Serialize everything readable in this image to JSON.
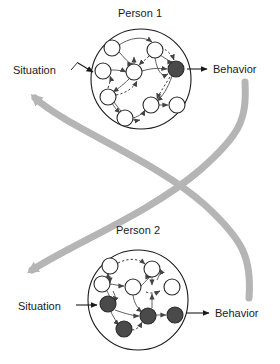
{
  "figure": {
    "type": "conceptual-diagram"
  },
  "panels": [
    {
      "id": "person1",
      "title": "Person 1",
      "input_label": "Situation",
      "output_label": "Behavior"
    },
    {
      "id": "person2",
      "title": "Person 2",
      "input_label": "Situation",
      "output_label": "Behavior"
    }
  ],
  "colors": {
    "node_fill_empty": "#ffffff",
    "node_fill_active": "#4a4a4a",
    "node_stroke": "#2b2b2b",
    "edge": "#555555",
    "boundary": "#1a1a1a",
    "feedback_arrow": "#b5b5b5",
    "text": "#1a1a1a",
    "background": "#ffffff"
  },
  "network_person1": {
    "boundary": {
      "cx": 141,
      "cy": 79,
      "r": 50
    },
    "nodes": [
      {
        "id": "p1n1",
        "cx": 112,
        "cy": 48,
        "r": 8,
        "state": "inactive"
      },
      {
        "id": "p1n2",
        "cx": 155,
        "cy": 50,
        "r": 8,
        "state": "inactive"
      },
      {
        "id": "p1n3",
        "cx": 103,
        "cy": 71,
        "r": 8,
        "state": "inactive"
      },
      {
        "id": "p1n4",
        "cx": 134,
        "cy": 72,
        "r": 8,
        "state": "inactive"
      },
      {
        "id": "p1n5",
        "cx": 176,
        "cy": 69,
        "r": 8,
        "state": "active"
      },
      {
        "id": "p1n6",
        "cx": 108,
        "cy": 97,
        "r": 8,
        "state": "inactive"
      },
      {
        "id": "p1n7",
        "cx": 151,
        "cy": 105,
        "r": 8,
        "state": "inactive"
      },
      {
        "id": "p1n8",
        "cx": 177,
        "cy": 105,
        "r": 8,
        "state": "inactive"
      },
      {
        "id": "p1n9",
        "cx": 125,
        "cy": 118,
        "r": 8,
        "state": "inactive"
      }
    ],
    "edge_count": 13,
    "dashed_edge_count": 5
  },
  "network_person2": {
    "boundary": {
      "cx": 138,
      "cy": 300,
      "r": 50
    },
    "nodes": [
      {
        "id": "p2n1",
        "cx": 110,
        "cy": 266,
        "r": 8,
        "state": "inactive"
      },
      {
        "id": "p2n2",
        "cx": 152,
        "cy": 269,
        "r": 8,
        "state": "inactive"
      },
      {
        "id": "p2n3",
        "cx": 102,
        "cy": 284,
        "r": 8,
        "state": "inactive"
      },
      {
        "id": "p2n4",
        "cx": 133,
        "cy": 287,
        "r": 8,
        "state": "inactive"
      },
      {
        "id": "p2n5",
        "cx": 172,
        "cy": 287,
        "r": 8,
        "state": "inactive"
      },
      {
        "id": "p2n6",
        "cx": 108,
        "cy": 304,
        "r": 8,
        "state": "active"
      },
      {
        "id": "p2n7",
        "cx": 148,
        "cy": 316,
        "r": 8,
        "state": "active"
      },
      {
        "id": "p2n8",
        "cx": 175,
        "cy": 315,
        "r": 8,
        "state": "active"
      },
      {
        "id": "p2n9",
        "cx": 124,
        "cy": 329,
        "r": 8,
        "state": "active"
      }
    ],
    "edge_count": 13,
    "dashed_edge_count": 4
  },
  "feedback": {
    "path_a_label": "Person 1 Behavior to Person 2 Situation",
    "path_b_label": "Person 2 Behavior to Person 1 Situation"
  }
}
